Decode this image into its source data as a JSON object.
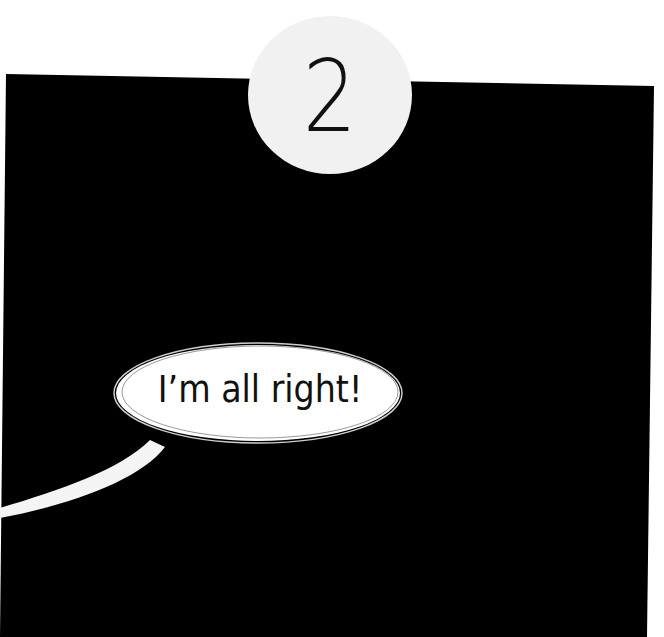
{
  "panel": {
    "background_color": "#000000",
    "page_color": "#ffffff"
  },
  "badge": {
    "number": "2",
    "fill_color": "#f1f1f1",
    "text_color": "#111111"
  },
  "speech_bubble": {
    "text": "I’m all right!",
    "fill_color": "#ffffff",
    "text_color": "#111111"
  }
}
